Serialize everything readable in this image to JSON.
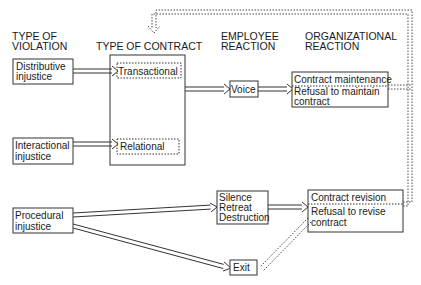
{
  "headers": {
    "violation": [
      "TYPE OF",
      "VIOLATION"
    ],
    "contract": "TYPE OF CONTRACT",
    "employee": [
      "EMPLOYEE",
      "REACTION"
    ],
    "organizational": [
      "ORGANIZATIONAL",
      "REACTION"
    ]
  },
  "violations": {
    "distributive": [
      "Distributive",
      "injustice"
    ],
    "interactional": [
      "Interactional",
      "injustice"
    ],
    "procedural": [
      "Procedural",
      "injustice"
    ]
  },
  "contracts": {
    "transactional": "Transactional",
    "relational": "Relational"
  },
  "employee_reactions": {
    "voice": "Voice",
    "silence": [
      "Silence",
      "Retreat",
      "Destruction"
    ],
    "exit": "Exit"
  },
  "organizational_reactions": {
    "maintenance": "Contract maintenance",
    "refusal_maintain": [
      "Refusal to maintain",
      "contract"
    ],
    "revision": "Contract revision",
    "refusal_revise": [
      "Refusal to revise",
      "contract"
    ]
  },
  "colors": {
    "line": "#333333",
    "text": "#1a1a1a",
    "background": "#ffffff"
  }
}
